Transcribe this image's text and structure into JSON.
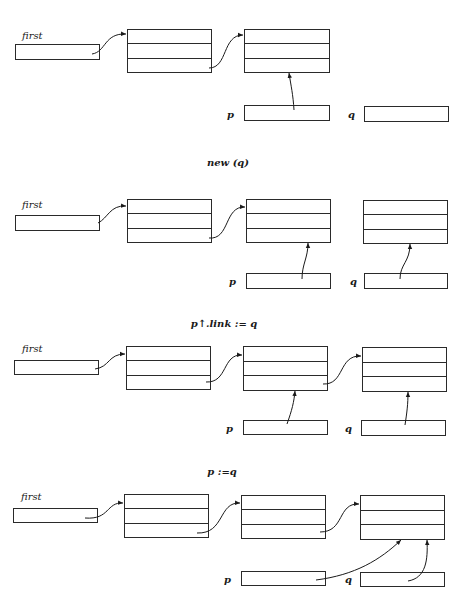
{
  "labels": {
    "first": "first",
    "p": "p",
    "q": "q"
  },
  "stages": [
    {
      "caption": "",
      "nodes": 2,
      "p_points_to": 2,
      "q_points_to": null
    },
    {
      "caption": "new (q)",
      "nodes": 3,
      "p_points_to": 2,
      "q_points_to": 3
    },
    {
      "caption": "p↑.link := q",
      "nodes": 3,
      "p_points_to": 2,
      "q_points_to": 3,
      "linked": true
    },
    {
      "caption": "p :=q",
      "nodes": 3,
      "p_points_to": 3,
      "q_points_to": 3,
      "linked": true
    }
  ],
  "colors": {
    "ink": "#1a1a1a",
    "paper": "#ffffff"
  }
}
